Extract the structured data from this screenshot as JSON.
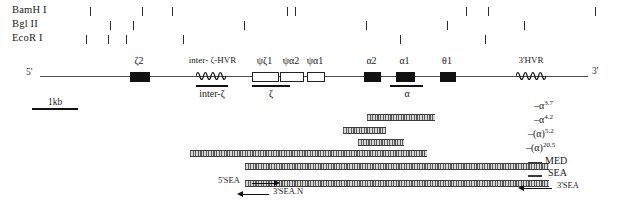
{
  "figure": {
    "type": "gene-map",
    "strand_labels": {
      "five_prime": "5'",
      "three_prime": "3'"
    },
    "scale": {
      "label": "1kb"
    }
  },
  "enzymes": [
    {
      "name": "BamH I",
      "sites": [
        90,
        142,
        172,
        287,
        295,
        466,
        488,
        595
      ]
    },
    {
      "name": "Bgl II",
      "sites": [
        110,
        133,
        244,
        366,
        447,
        524
      ]
    },
    {
      "name": "EcoR I",
      "sites": [
        86,
        108,
        126,
        183,
        400,
        485
      ]
    }
  ],
  "genes": [
    {
      "label": "ζ2",
      "type": "filled",
      "x": 130,
      "w": 18
    },
    {
      "label": "ψζ1",
      "type": "open",
      "x": 252,
      "w": 25
    },
    {
      "label": "ψα2",
      "type": "open",
      "x": 280,
      "w": 22
    },
    {
      "label": "ψα1",
      "type": "open",
      "x": 307,
      "w": 16
    },
    {
      "label": "α2",
      "type": "filled",
      "x": 364,
      "w": 15
    },
    {
      "label": "α1",
      "type": "filled",
      "x": 396,
      "w": 17
    },
    {
      "label": "θ1",
      "type": "filled",
      "x": 440,
      "w": 14
    }
  ],
  "hvr_regions": [
    {
      "label": "inter- ζ-HVR",
      "x": 196,
      "w": 30,
      "label_x": 170,
      "label_w": 85
    },
    {
      "label": "3'HVR",
      "x": 516,
      "w": 30,
      "label_x": 500,
      "label_w": 62
    }
  ],
  "probes": [
    {
      "label": "inter-ζ",
      "bar_x": 196,
      "bar_w": 32,
      "label_x": 176,
      "label_w": 72
    },
    {
      "label": "ζ",
      "bar_x": 252,
      "bar_w": 38,
      "label_x": 243,
      "label_w": 56
    },
    {
      "label": "α",
      "bar_x": 390,
      "bar_w": 33,
      "label_x": 383,
      "label_w": 48
    }
  ],
  "deletions": [
    {
      "label": "–α",
      "sup": "3.7",
      "x": 367,
      "w": 68,
      "y": 114,
      "label_x": 534,
      "label_y": 99
    },
    {
      "label": "–α",
      "sup": "4.2",
      "x": 343,
      "w": 43,
      "y": 127,
      "label_x": 534,
      "label_y": 113
    },
    {
      "label": "–(α)",
      "sup": "5.2",
      "x": 358,
      "w": 46,
      "y": 139,
      "label_x": 528,
      "label_y": 127
    },
    {
      "label": "–(α)",
      "sup": "20.5",
      "x": 190,
      "w": 237,
      "y": 150,
      "label_x": 526,
      "label_y": 141
    },
    {
      "label": "MED",
      "sup": "",
      "x": 245,
      "w": 304,
      "y": 163,
      "label_x": 545,
      "label_y": 155,
      "dash_x": 528,
      "dash_y": 162
    },
    {
      "label": "SEA",
      "sup": "",
      "x": 0,
      "w": 0,
      "y": 0,
      "label_x": 548,
      "label_y": 167,
      "dash_x": 528,
      "dash_y": 175
    }
  ],
  "sea_bar": {
    "x": 245,
    "w": 304,
    "y": 180
  },
  "sea_arrows": [
    {
      "label": "5'SEA",
      "dir": "right",
      "label_x": 218,
      "label_y": 175,
      "line_x": 252,
      "line_w": 22,
      "y": 180
    },
    {
      "label": "3'SEA.N",
      "dir": "left",
      "label_x": 273,
      "label_y": 186,
      "line_x": 243,
      "line_w": 26,
      "y": 191
    },
    {
      "label": "3'SEA",
      "dir": "left",
      "label_x": 557,
      "label_y": 180,
      "line_x": 524,
      "line_w": 28,
      "y": 185
    }
  ],
  "backbone": {
    "x": 40,
    "w": 548,
    "y": 76
  }
}
